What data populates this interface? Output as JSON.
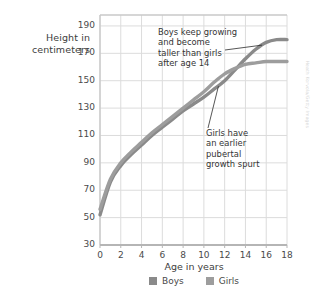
{
  "chart_data": {
    "type": "line",
    "title": "",
    "xlabel": "Age in years",
    "ylabel": "Height in centimeters",
    "xlim": [
      0,
      18
    ],
    "ylim": [
      30,
      198
    ],
    "xticks": [
      0,
      2,
      4,
      6,
      8,
      10,
      12,
      14,
      16,
      18
    ],
    "yticks": [
      30,
      50,
      70,
      90,
      110,
      130,
      150,
      170,
      190
    ],
    "grid": true,
    "legend_position": "bottom",
    "x": [
      0,
      1,
      2,
      3,
      4,
      5,
      6,
      7,
      8,
      9,
      10,
      11,
      12,
      13,
      14,
      15,
      16,
      17,
      18
    ],
    "series": [
      {
        "name": "Boys",
        "color": "#8a8a8a",
        "values": [
          52,
          76,
          88,
          96,
          103,
          110,
          116,
          122,
          128,
          133,
          138,
          144,
          150,
          158,
          166,
          173,
          178,
          180,
          180
        ]
      },
      {
        "name": "Girls",
        "color": "#9d9d9d",
        "values": [
          56,
          78,
          90,
          98,
          105,
          112,
          118,
          124,
          130,
          136,
          142,
          149,
          155,
          159,
          162,
          163,
          164,
          164,
          164
        ]
      }
    ],
    "annotations": [
      {
        "id": "boys-note",
        "text": "Boys keep growing\nand become\ntaller than girls\nafter age 14",
        "points_to": {
          "x": 15.6,
          "y": 176
        }
      },
      {
        "id": "girls-note",
        "text": "Girls have\nan earlier\npubertal\ngrowth spurt",
        "points_to": {
          "x": 11.4,
          "y": 146
        }
      }
    ]
  },
  "axis": {
    "y_title": "Height in\ncentimeters",
    "x_title": "Age in years"
  },
  "legend": {
    "items": [
      {
        "label": "Boys",
        "color": "#8a8a8a"
      },
      {
        "label": "Girls",
        "color": "#9d9d9d"
      }
    ]
  },
  "credit": {
    "text": "Heath Korvola/Getty Images"
  },
  "colors": {
    "grid": "#dcdcdc",
    "frame": "#c9c9c9",
    "text": "#3f3f3f",
    "background": "#ffffff"
  }
}
